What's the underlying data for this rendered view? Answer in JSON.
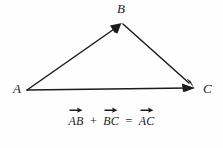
{
  "figure": {
    "type": "vector-triangle-diagram",
    "background_color": "#fefefe",
    "stroke_color": "#1c1c1c",
    "vertices": [
      {
        "id": "A",
        "label": "A",
        "x": 27,
        "y": 90
      },
      {
        "id": "B",
        "label": "B",
        "x": 122,
        "y": 23
      },
      {
        "id": "C",
        "label": "C",
        "x": 194,
        "y": 88
      }
    ],
    "vectors": [
      {
        "name": "AB",
        "from": "A",
        "to": "B",
        "arrowhead_at": "B"
      },
      {
        "name": "BC",
        "from": "B",
        "to": "C",
        "arrowhead_at": "C"
      },
      {
        "name": "AC",
        "from": "A",
        "to": "C",
        "arrowhead_at": "C"
      }
    ]
  },
  "equation": {
    "full_text": "AB + BC = AC",
    "term1": "AB",
    "operator1": "+",
    "term2": "BC",
    "operator2": "=",
    "term3": "AC"
  }
}
